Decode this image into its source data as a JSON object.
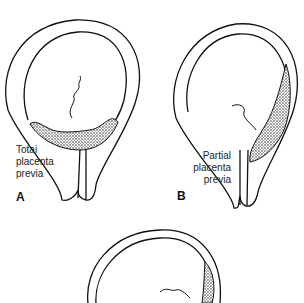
{
  "figures": [
    {
      "id": "A",
      "letter": "A",
      "caption_lines": [
        "Totai",
        "placenta",
        "previa"
      ]
    },
    {
      "id": "B",
      "letter": "B",
      "caption_lines": [
        "Partial",
        "placenta",
        "previa"
      ]
    },
    {
      "id": "C",
      "letter": "",
      "caption_lines": []
    }
  ],
  "colors": {
    "line": "#111111",
    "background": "#ffffff",
    "stipple": "#555555"
  }
}
